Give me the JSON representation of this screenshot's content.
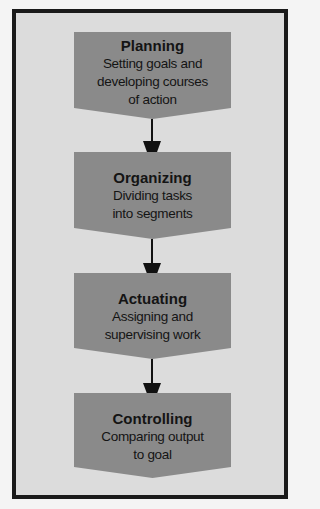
{
  "colors": {
    "page_background": "#f4f4f4",
    "frame_background": "#dcdcdc",
    "frame_border": "#1a1a1a",
    "step_fill": "#8a8a8a",
    "arrow": "#111111",
    "text": "#141414"
  },
  "steps": [
    {
      "title": "Planning",
      "description": "Setting goals and\ndeveloping courses\nof action"
    },
    {
      "title": "Organizing",
      "description": "Dividing tasks\ninto segments"
    },
    {
      "title": "Actuating",
      "description": "Assigning and\nsupervising work"
    },
    {
      "title": "Controlling",
      "description": "Comparing output\nto goal"
    }
  ]
}
